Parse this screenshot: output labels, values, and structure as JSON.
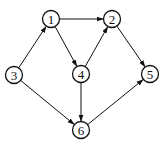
{
  "diagram": {
    "type": "directed-graph",
    "nodes": [
      {
        "id": "1",
        "label": "1",
        "x": 51,
        "y": 19
      },
      {
        "id": "2",
        "label": "2",
        "x": 112,
        "y": 19
      },
      {
        "id": "3",
        "label": "3",
        "x": 14,
        "y": 75
      },
      {
        "id": "4",
        "label": "4",
        "x": 81,
        "y": 74
      },
      {
        "id": "5",
        "label": "5",
        "x": 150,
        "y": 74
      },
      {
        "id": "6",
        "label": "6",
        "x": 81,
        "y": 130
      }
    ],
    "edges": [
      {
        "from": "1",
        "to": "2"
      },
      {
        "from": "1",
        "to": "4"
      },
      {
        "from": "3",
        "to": "1"
      },
      {
        "from": "3",
        "to": "6"
      },
      {
        "from": "4",
        "to": "2"
      },
      {
        "from": "4",
        "to": "6"
      },
      {
        "from": "2",
        "to": "5"
      },
      {
        "from": "6",
        "to": "5"
      }
    ],
    "node_radius": 8.5,
    "stroke_color": "#111111",
    "background": "#ffffff"
  }
}
